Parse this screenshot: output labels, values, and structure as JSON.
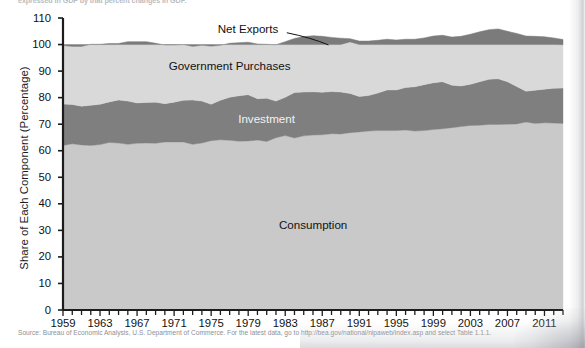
{
  "caption": {
    "clipped_heading": "expressed in GDP by that percent changes in GDP."
  },
  "chart_data": {
    "type": "area",
    "title": "",
    "subtitle": "",
    "xlabel": "",
    "ylabel": "Share of Each Component (Percentage)",
    "ylim": [
      0,
      110
    ],
    "ytick_step": 10,
    "yticks": [
      0,
      10,
      20,
      30,
      40,
      50,
      60,
      70,
      80,
      90,
      100,
      110
    ],
    "xlim": [
      1959,
      2013
    ],
    "xticks_labeled": [
      1959,
      1963,
      1967,
      1971,
      1975,
      1979,
      1983,
      1987,
      1991,
      1995,
      1999,
      2003,
      2007,
      2011
    ],
    "xtick_minor_step": 1,
    "grid": false,
    "legend_position": "inline-annotations",
    "stacked": true,
    "stack_total_note": "Consumption + Investment + Government Purchases + Net Exports = 100",
    "x": [
      1959,
      1960,
      1961,
      1962,
      1963,
      1964,
      1965,
      1966,
      1967,
      1968,
      1969,
      1970,
      1971,
      1972,
      1973,
      1974,
      1975,
      1976,
      1977,
      1978,
      1979,
      1980,
      1981,
      1982,
      1983,
      1984,
      1985,
      1986,
      1987,
      1988,
      1989,
      1990,
      1991,
      1992,
      1993,
      1994,
      1995,
      1996,
      1997,
      1998,
      1999,
      2000,
      2001,
      2002,
      2003,
      2004,
      2005,
      2006,
      2007,
      2008,
      2009,
      2010,
      2011,
      2012,
      2013
    ],
    "series": [
      {
        "name": "Consumption",
        "color": "#c9c9c9",
        "label_color": "#111111",
        "label_x": 1986,
        "label_y": 32,
        "values": [
          62.0,
          62.6,
          62.2,
          62.0,
          62.3,
          63.1,
          62.9,
          62.4,
          62.8,
          62.9,
          62.8,
          63.3,
          63.3,
          63.3,
          62.4,
          62.9,
          63.8,
          64.1,
          63.9,
          63.6,
          63.7,
          64.0,
          63.5,
          64.9,
          65.7,
          64.8,
          65.6,
          65.9,
          66.0,
          66.4,
          66.3,
          66.8,
          67.1,
          67.4,
          67.6,
          67.6,
          67.6,
          67.8,
          67.4,
          67.6,
          68.0,
          68.3,
          68.7,
          69.1,
          69.5,
          69.6,
          69.9,
          69.9,
          70.0,
          70.1,
          70.8,
          70.3,
          70.5,
          70.4,
          70.3
        ]
      },
      {
        "name": "Investment",
        "color": "#7f7f7f",
        "label_color": "#f2f2f2",
        "label_x": 1981,
        "label_y": 72,
        "values": [
          15.6,
          14.8,
          14.6,
          15.1,
          15.2,
          15.3,
          16.2,
          16.3,
          15.2,
          15.3,
          15.5,
          14.4,
          15.0,
          15.7,
          16.7,
          15.8,
          13.7,
          14.9,
          16.2,
          17.1,
          17.4,
          15.6,
          16.3,
          13.8,
          14.4,
          17.1,
          16.5,
          16.3,
          16.0,
          15.9,
          15.8,
          14.8,
          13.3,
          13.4,
          14.1,
          15.3,
          15.3,
          16.0,
          16.7,
          17.3,
          17.6,
          17.7,
          16.0,
          15.3,
          15.5,
          16.4,
          17.0,
          17.2,
          16.0,
          14.1,
          11.6,
          12.5,
          12.7,
          13.1,
          13.3
        ]
      },
      {
        "name": "Government Purchases",
        "color": "#d9d9d9",
        "label_color": "#111111",
        "label_x": 1977,
        "label_y": 92,
        "values": [
          22.0,
          21.9,
          22.5,
          23.0,
          22.6,
          22.0,
          21.3,
          22.4,
          23.1,
          22.9,
          22.2,
          22.1,
          21.5,
          21.0,
          20.2,
          21.0,
          21.9,
          20.7,
          20.4,
          20.0,
          19.8,
          20.6,
          20.3,
          21.2,
          21.0,
          20.4,
          20.9,
          21.1,
          21.1,
          20.4,
          20.3,
          20.6,
          20.9,
          20.5,
          19.9,
          19.1,
          18.8,
          18.2,
          17.9,
          17.6,
          17.6,
          17.5,
          18.1,
          18.7,
          18.9,
          18.8,
          18.7,
          18.8,
          19.0,
          20.0,
          20.8,
          20.3,
          19.7,
          19.0,
          18.3
        ]
      },
      {
        "name": "Net Exports",
        "color": "#7b7b7b",
        "label_color": "#111111",
        "label_x": 1979,
        "label_y": 106,
        "values": [
          0.4,
          0.7,
          0.7,
          -0.1,
          -0.1,
          -0.4,
          -0.4,
          -1.1,
          -1.1,
          -1.1,
          -0.5,
          0.2,
          0.2,
          0.0,
          0.7,
          0.3,
          0.6,
          0.3,
          -0.5,
          -0.7,
          -0.9,
          -0.2,
          -0.1,
          0.1,
          -1.1,
          -2.3,
          -3.0,
          -3.3,
          -3.1,
          -2.7,
          -2.4,
          -1.2,
          -1.3,
          -1.3,
          -1.6,
          -2.0,
          -1.7,
          -2.0,
          -2.0,
          -2.5,
          -3.2,
          -3.5,
          -2.8,
          -3.1,
          -3.9,
          -4.8,
          -5.6,
          -5.9,
          -5.0,
          -4.2,
          -3.2,
          -3.1,
          -2.9,
          -2.5,
          -2.0
        ]
      }
    ],
    "annotations": [
      {
        "text": "Net Exports",
        "leader_line": true,
        "leader_from_x": 1979.5,
        "leader_from_y": 105.2,
        "leader_to_x": 1984,
        "leader_to_y": 100.6
      }
    ]
  },
  "source": {
    "note": "Source: Bureau of Economic Analysis, U.S. Department of Commerce. For the latest data, go to http://bea.gov/national/nipaweb/index.asp and select Table 1.1.1."
  },
  "colors": {
    "consumption": "#c9c9c9",
    "investment": "#7f7f7f",
    "government": "#d9d9d9",
    "net_exports": "#7b7b7b",
    "axis": "#1c1c1c",
    "text": "#111111",
    "source_text": "#8d8f94"
  }
}
